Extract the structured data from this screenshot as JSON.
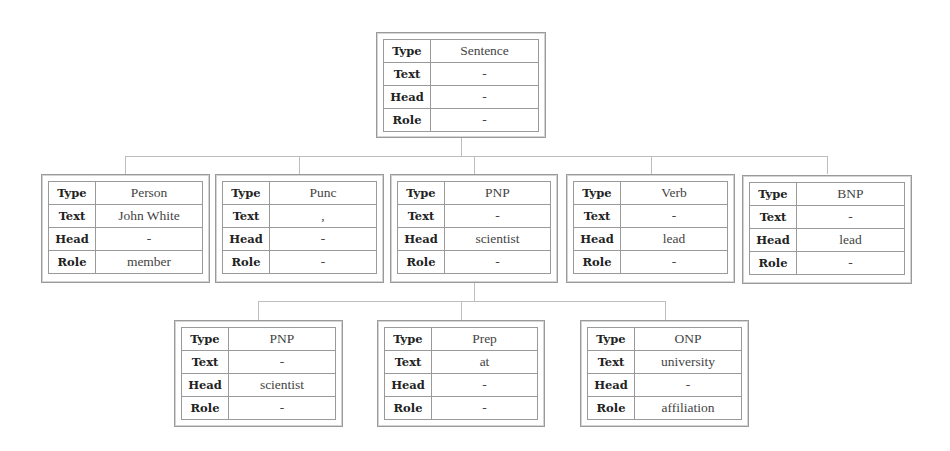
{
  "labels": {
    "type": "Type",
    "text": "Text",
    "head": "Head",
    "role": "Role"
  },
  "root": {
    "type": "Sentence",
    "text": "-",
    "head": "-",
    "role": "-"
  },
  "level1": [
    {
      "type": "Person",
      "text": "John White",
      "head": "-",
      "role": "member"
    },
    {
      "type": "Punc",
      "text": ",",
      "head": "-",
      "role": "-"
    },
    {
      "type": "PNP",
      "text": "-",
      "head": "scientist",
      "role": "-"
    },
    {
      "type": "Verb",
      "text": "-",
      "head": "lead",
      "role": "-"
    },
    {
      "type": "BNP",
      "text": "-",
      "head": "lead",
      "role": "-"
    }
  ],
  "level2": [
    {
      "type": "PNP",
      "text": "-",
      "head": "scientist",
      "role": "-"
    },
    {
      "type": "Prep",
      "text": "at",
      "head": "-",
      "role": "-"
    },
    {
      "type": "ONP",
      "text": "university",
      "head": "-",
      "role": "affiliation"
    }
  ]
}
